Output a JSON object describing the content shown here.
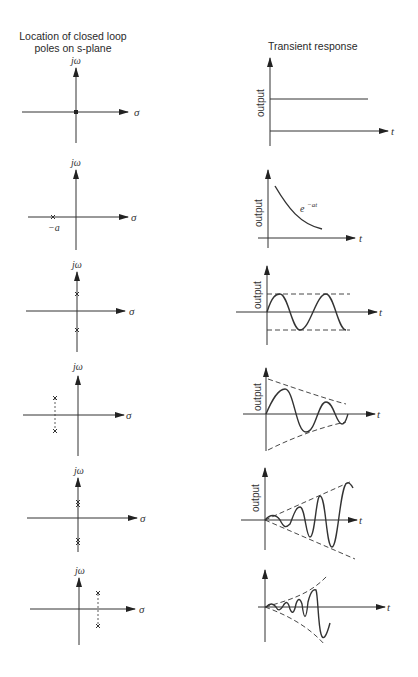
{
  "headers": {
    "left_line1": "Location of closed loop",
    "left_line2": "poles on s-plane",
    "right": "Transient response"
  },
  "axis_labels": {
    "imag": "jω",
    "real": "σ",
    "time": "t",
    "output": "output"
  },
  "rows": [
    {
      "poles": "single pole at origin",
      "response": "constant output",
      "annotation": ""
    },
    {
      "poles": "single real pole at -a",
      "pole_label": "−a",
      "response": "exponential decay",
      "annotation": "e^{-at}",
      "annotation_base": "e",
      "annotation_exp": "−at"
    },
    {
      "poles": "pair of poles on imaginary axis",
      "response": "sustained oscillation"
    },
    {
      "poles": "complex pair in left half-plane",
      "response": "damped oscillation"
    },
    {
      "poles": "repeated pair on imaginary axis",
      "response": "growing oscillation (linear envelope)"
    },
    {
      "poles": "complex pair in right half-plane",
      "response": "exponentially growing oscillation"
    }
  ],
  "colors": {
    "ink": "#2a2a2a",
    "background": "#ffffff"
  }
}
